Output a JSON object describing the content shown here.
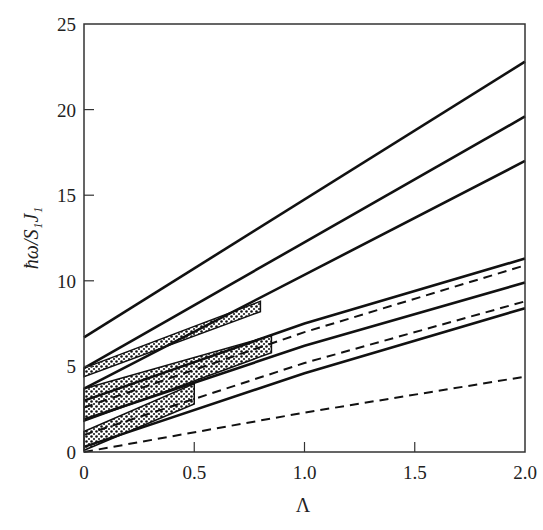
{
  "chart_data": {
    "type": "line",
    "title": "",
    "xlabel": "Λ",
    "ylabel": "ħω/S₁J₁",
    "xlim": [
      0,
      2.0
    ],
    "ylim": [
      0,
      25
    ],
    "x_ticks": [
      "0",
      "0.5",
      "1.0",
      "1.5",
      "2.0"
    ],
    "y_ticks": [
      "0",
      "5",
      "10",
      "15",
      "20",
      "25"
    ],
    "grid": false,
    "legend": "none",
    "series": [
      {
        "name": "solid-1",
        "style": "solid",
        "x": [
          0,
          2.0
        ],
        "y": [
          6.7,
          22.8
        ]
      },
      {
        "name": "solid-2",
        "style": "solid",
        "x": [
          0,
          2.0
        ],
        "y": [
          4.9,
          19.6
        ]
      },
      {
        "name": "solid-3",
        "style": "solid",
        "x": [
          0,
          2.0
        ],
        "y": [
          3.7,
          17.0
        ]
      },
      {
        "name": "solid-4",
        "style": "solid",
        "x": [
          0,
          1.0,
          2.0
        ],
        "y": [
          3.0,
          7.5,
          11.3
        ]
      },
      {
        "name": "dashed-1",
        "style": "dashed",
        "x": [
          0,
          1.0,
          2.0
        ],
        "y": [
          2.6,
          7.0,
          10.9
        ]
      },
      {
        "name": "solid-5",
        "style": "solid",
        "x": [
          0,
          1.0,
          2.0
        ],
        "y": [
          1.9,
          6.2,
          9.9
        ]
      },
      {
        "name": "dashed-2",
        "style": "dashed",
        "x": [
          0,
          1.0,
          2.0
        ],
        "y": [
          1.0,
          5.2,
          8.8
        ]
      },
      {
        "name": "solid-6",
        "style": "solid",
        "x": [
          0,
          1.0,
          2.0
        ],
        "y": [
          0.3,
          4.6,
          8.4
        ]
      },
      {
        "name": "dashed-3",
        "style": "dashed",
        "x": [
          0,
          1.0,
          2.0
        ],
        "y": [
          0.0,
          2.3,
          4.4
        ]
      }
    ],
    "shaded_bands": [
      {
        "name": "band-upper",
        "x": [
          0,
          0.8
        ],
        "y_low": [
          4.4,
          8.2
        ],
        "y_high": [
          4.9,
          8.8
        ]
      },
      {
        "name": "band-middle",
        "x": [
          0,
          0.85
        ],
        "y_low": [
          1.8,
          5.8
        ],
        "y_high": [
          3.7,
          6.8
        ]
      },
      {
        "name": "band-lower",
        "x": [
          0,
          0.5
        ],
        "y_low": [
          0.1,
          2.8
        ],
        "y_high": [
          1.2,
          4.0
        ]
      }
    ]
  }
}
